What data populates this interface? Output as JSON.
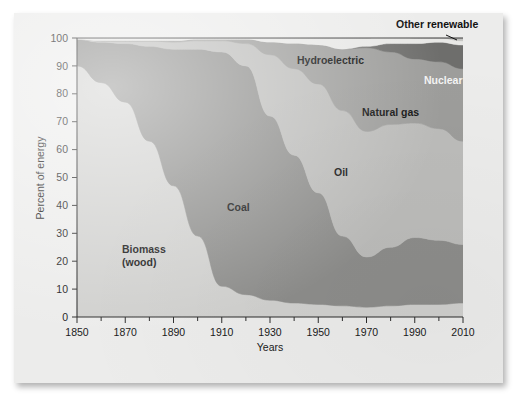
{
  "figure": {
    "background_color": "#ececeb",
    "plot_background_color": "#d8d8d6"
  },
  "chart_data": {
    "type": "area",
    "stacked": true,
    "title": "",
    "subtitle": "",
    "xlabel": "Years",
    "ylabel": "Percent of energy",
    "xlim": [
      1850,
      2010
    ],
    "ylim": [
      0,
      100
    ],
    "grid": false,
    "legend_position": "inline-labels",
    "x_tick_labels": [
      "1850",
      "1870",
      "1890",
      "1910",
      "1930",
      "1950",
      "1970",
      "1990",
      "2010"
    ],
    "x_ticks": [
      1850,
      1870,
      1890,
      1910,
      1930,
      1950,
      1970,
      1990,
      2010
    ],
    "x_minor_ticks": [
      1860,
      1880,
      1900,
      1920,
      1940,
      1960,
      1980,
      2000
    ],
    "y_tick_labels": [
      "0",
      "10",
      "20",
      "30",
      "40",
      "50",
      "60",
      "70",
      "80",
      "90",
      "100"
    ],
    "y_ticks": [
      0,
      10,
      20,
      30,
      40,
      50,
      60,
      70,
      80,
      90,
      100
    ],
    "x": [
      1850,
      1860,
      1870,
      1880,
      1890,
      1900,
      1910,
      1920,
      1930,
      1940,
      1950,
      1960,
      1970,
      1980,
      1990,
      2000,
      2010
    ],
    "series": [
      {
        "name": "Biomass (wood)",
        "color": "#d0d0ce",
        "label_color": "#111111",
        "values": [
          90,
          84,
          77,
          63,
          47,
          29,
          11,
          8,
          6,
          5,
          4.5,
          4,
          3.5,
          4,
          4.5,
          4.5,
          5
        ]
      },
      {
        "name": "Coal",
        "color": "#8d8d8b",
        "label_color": "#111111",
        "values": [
          9.5,
          14.5,
          21,
          34,
          49,
          67,
          84,
          82,
          66,
          53,
          40,
          25,
          18,
          21,
          24,
          23,
          21
        ]
      },
      {
        "name": "Oil",
        "color": "#bcbcba",
        "label_color": "#111111",
        "values": [
          0,
          0.5,
          1,
          2,
          2.5,
          3,
          4,
          8,
          22,
          31,
          39,
          45,
          45,
          44,
          41,
          40,
          37
        ]
      },
      {
        "name": "Natural gas",
        "color": "#9d9d9b",
        "label_color": "#111111",
        "values": [
          0,
          0,
          0,
          0,
          0.5,
          0.5,
          0.5,
          1.5,
          4.5,
          9,
          14,
          22,
          30,
          26,
          23,
          24,
          26
        ]
      },
      {
        "name": "Nuclear",
        "color": "#6e6e6c",
        "label_color": "#f4f4f4",
        "values": [
          0,
          0,
          0,
          0,
          0,
          0,
          0,
          0,
          0,
          0,
          0,
          0,
          0.5,
          3,
          5.5,
          7,
          8.5
        ]
      },
      {
        "name": "Hydroelectric",
        "color": "#e8e8e6",
        "label_color": "#111111",
        "values": [
          0.5,
          1,
          1,
          1,
          1,
          0.5,
          0.5,
          0.5,
          1.5,
          2,
          2.5,
          4,
          3,
          4,
          2,
          1.5,
          1.5
        ]
      },
      {
        "name": "Other renewable",
        "color": "#c2c2c0",
        "label_color": "#111111",
        "values": [
          0,
          0,
          0,
          0,
          0,
          0,
          0,
          0,
          0,
          0,
          0,
          0,
          0,
          0,
          0,
          0,
          1
        ]
      }
    ],
    "inline_labels": [
      {
        "text": "Biomass",
        "text2": "(wood)",
        "x": 108,
        "y": 240,
        "style": "dark"
      },
      {
        "text": "Coal",
        "x": 213,
        "y": 198,
        "style": "dark"
      },
      {
        "text": "Oil",
        "x": 320,
        "y": 163,
        "style": "dark"
      },
      {
        "text": "Natural gas",
        "x": 348,
        "y": 103,
        "style": "dark"
      },
      {
        "text": "Nuclear",
        "x": 410,
        "y": 71,
        "style": "light"
      },
      {
        "text": "Hydroelectric",
        "x": 283,
        "y": 51,
        "style": "dark"
      },
      {
        "text": "Other renewable",
        "x": 382,
        "y": 15,
        "style": "dark"
      }
    ]
  }
}
